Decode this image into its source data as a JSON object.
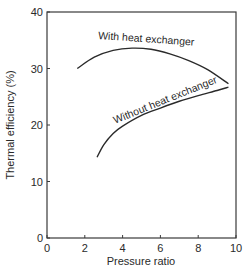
{
  "chart_data": {
    "type": "line",
    "title": "",
    "xlabel": "Pressure ratio",
    "ylabel": "Thermal efficiency (%)",
    "xlim": [
      0,
      10
    ],
    "ylim": [
      0,
      40
    ],
    "xticks": [
      0,
      2,
      4,
      6,
      8,
      10
    ],
    "yticks": [
      0,
      10,
      20,
      30,
      40
    ],
    "grid": false,
    "legend": "inline labels along curves",
    "series": [
      {
        "name": "With heat exchanger",
        "x": [
          1.6,
          2.5,
          3.5,
          4.5,
          5.5,
          6.5,
          7.5,
          8.5,
          9.6
        ],
        "y": [
          30.0,
          32.0,
          33.2,
          33.6,
          33.4,
          32.6,
          31.4,
          29.8,
          27.3
        ]
      },
      {
        "name": "Without heat exchanger",
        "x": [
          2.65,
          3.0,
          3.5,
          4.0,
          5.0,
          6.0,
          7.0,
          8.0,
          9.0,
          9.6
        ],
        "y": [
          14.3,
          16.5,
          18.5,
          19.8,
          21.7,
          23.0,
          24.2,
          25.2,
          26.1,
          26.7
        ]
      }
    ]
  },
  "colors": {
    "line": "#2a2a2a",
    "axis": "#3a3a3a",
    "background": "#ffffff"
  }
}
